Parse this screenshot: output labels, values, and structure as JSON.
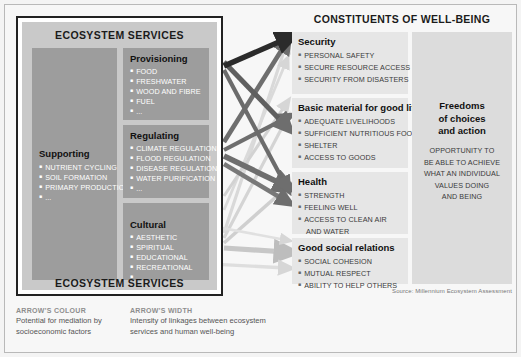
{
  "figure": {
    "left_panel_title": "ECOSYSTEM SERVICES",
    "left_panel_title_bottom": "ECOSYSTEM SERVICES",
    "right_panel_title": "CONSTITUENTS OF WELL-BEING",
    "source": "Source: Millennium Ecosystem Assessment"
  },
  "ecosystem_services": {
    "supporting": {
      "heading": "Supporting",
      "items": [
        "NUTRIENT CYCLING",
        "SOIL FORMATION",
        "PRIMARY PRODUCTION",
        "..."
      ]
    },
    "provisioning": {
      "heading": "Provisioning",
      "items": [
        "FOOD",
        "FRESHWATER",
        "WOOD AND FIBRE",
        "FUEL",
        "..."
      ]
    },
    "regulating": {
      "heading": "Regulating",
      "items": [
        "CLIMATE REGULATION",
        "FLOOD REGULATION",
        "DISEASE REGULATION",
        "WATER PURIFICATION",
        "..."
      ]
    },
    "cultural": {
      "heading": "Cultural",
      "items": [
        "AESTHETIC",
        "SPIRITUAL",
        "EDUCATIONAL",
        "RECREATIONAL",
        "..."
      ]
    }
  },
  "wellbeing": {
    "security": {
      "heading": "Security",
      "items": [
        "PERSONAL SAFETY",
        "SECURE RESOURCE ACCESS",
        "SECURITY FROM DISASTERS"
      ]
    },
    "basic_material": {
      "heading": "Basic material for good life",
      "items": [
        "ADEQUATE LIVELIHOODS",
        "SUFFICIENT NUTRITIOUS FOOD",
        "SHELTER",
        "ACCESS TO GOODS"
      ]
    },
    "health": {
      "heading": "Health",
      "items": [
        "STRENGTH",
        "FEELING WELL",
        "ACCESS TO CLEAN AIR",
        "AND WATER"
      ]
    },
    "social_relations": {
      "heading": "Good social relations",
      "items": [
        "SOCIAL COHESION",
        "MUTUAL RESPECT",
        "ABILITY TO HELP OTHERS"
      ]
    },
    "freedoms": {
      "heading": "Freedoms\nof choices\nand action",
      "body": "OPPORTUNITY TO\nBE ABLE TO ACHIEVE\nWHAT AN INDIVIDUAL\nVALUES DOING\nAND BEING"
    }
  },
  "legend": {
    "colour": {
      "heading": "ARROW'S COLOUR",
      "body": "Potential for mediation by\nsocioeconomic factors"
    },
    "width": {
      "heading": "ARROW'S WIDTH",
      "body": "Intensity of linkages between ecosystem\nservices and human well-being"
    }
  },
  "colors": {
    "panel_bg": "#f7f7f7",
    "services_block": "#c9c9c9",
    "service_box": "#9d9d9d",
    "wellbeing_box": "#e6e6e6",
    "freedoms_box": "#dcdcdc",
    "arrow_dark": "#2b2b2b",
    "arrow_medium": "#6e6e6e",
    "arrow_light": "#bdbdbd",
    "arrow_very_light": "#dcdcdc"
  },
  "chart_data": {
    "type": "diagram",
    "note": "Arrow colour = potential for mediation by socioeconomic factors; arrow width = intensity of linkages",
    "links": [
      {
        "from": "Provisioning",
        "to": "Security",
        "width": "strong",
        "mediation": "low"
      },
      {
        "from": "Provisioning",
        "to": "Basic material for good life",
        "width": "strong",
        "mediation": "medium"
      },
      {
        "from": "Provisioning",
        "to": "Health",
        "width": "medium",
        "mediation": "medium"
      },
      {
        "from": "Regulating",
        "to": "Security",
        "width": "medium",
        "mediation": "medium"
      },
      {
        "from": "Regulating",
        "to": "Basic material for good life",
        "width": "medium",
        "mediation": "medium"
      },
      {
        "from": "Regulating",
        "to": "Health",
        "width": "strong",
        "mediation": "medium"
      },
      {
        "from": "Regulating",
        "to": "Good social relations",
        "width": "weak",
        "mediation": "high"
      },
      {
        "from": "Cultural",
        "to": "Security",
        "width": "weak",
        "mediation": "high"
      },
      {
        "from": "Cultural",
        "to": "Basic material for good life",
        "width": "weak",
        "mediation": "high"
      },
      {
        "from": "Cultural",
        "to": "Health",
        "width": "weak",
        "mediation": "high"
      },
      {
        "from": "Cultural",
        "to": "Good social relations",
        "width": "medium",
        "mediation": "high"
      },
      {
        "from": "Supporting",
        "to": "Good social relations",
        "width": "weak",
        "mediation": "high"
      }
    ]
  }
}
